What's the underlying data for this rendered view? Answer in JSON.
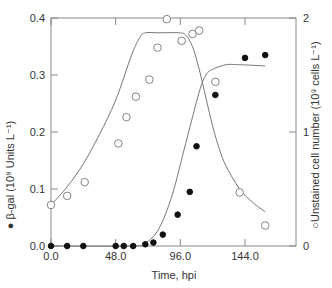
{
  "chart_data": {
    "type": "scatter",
    "title": "",
    "xlabel": "Time, hpi",
    "ylabel_left": "● β-gal (10⁸ Units L⁻¹)",
    "ylabel_right": "○Unstained cell number (10⁹ cells L⁻¹)",
    "xlim": [
      0,
      182
    ],
    "ylim_left": [
      0,
      0.4
    ],
    "ylim_right": [
      0,
      2
    ],
    "x_ticks": [
      "0.0",
      "48.0",
      "96.0",
      "144.0"
    ],
    "x_tick_values": [
      0,
      48,
      96,
      144
    ],
    "y_left_ticks": [
      "0.0",
      "0.1",
      "0.2",
      "0.3",
      "0.4"
    ],
    "y_left_tick_values": [
      0,
      0.1,
      0.2,
      0.3,
      0.4
    ],
    "y_right_ticks": [
      "0",
      "1",
      "2"
    ],
    "y_right_tick_values": [
      0,
      1,
      2
    ],
    "grid": false,
    "legend": "embedded in axis labels (filled circle = β-gal, open circle = unstained cells)",
    "series": [
      {
        "name": "β-gal",
        "axis": "left",
        "marker": "filled-circle",
        "x": [
          0,
          12,
          24,
          48,
          54,
          61,
          70,
          76,
          83,
          94,
          103,
          108,
          122,
          144,
          159
        ],
        "y": [
          0,
          0,
          0,
          0,
          0,
          0,
          0.003,
          0.006,
          0.02,
          0.055,
          0.095,
          0.175,
          0.265,
          0.33,
          0.335
        ]
      },
      {
        "name": "Unstained cell number",
        "axis": "right",
        "marker": "open-circle",
        "x": [
          0,
          12,
          25,
          50,
          56,
          63,
          73,
          79,
          86,
          97,
          105,
          110,
          122,
          140,
          159
        ],
        "y": [
          0.36,
          0.44,
          0.56,
          0.9,
          1.13,
          1.31,
          1.46,
          1.74,
          1.99,
          1.8,
          1.86,
          1.89,
          1.44,
          0.47,
          0.18
        ]
      }
    ],
    "fit_curves": [
      {
        "name": "β-gal fit (sigmoid)",
        "axis": "left",
        "x": [
          0,
          60,
          70,
          80,
          90,
          100,
          110,
          115,
          120,
          130,
          140,
          159
        ],
        "y": [
          0,
          0,
          0.005,
          0.03,
          0.09,
          0.18,
          0.27,
          0.3,
          0.31,
          0.318,
          0.318,
          0.316
        ]
      },
      {
        "name": "Cell number fit",
        "axis": "right",
        "x": [
          0,
          12,
          24,
          36,
          48,
          60,
          66,
          70,
          80,
          95,
          100,
          105,
          110,
          115,
          120,
          125,
          130,
          140,
          150,
          159
        ],
        "y": [
          0.36,
          0.52,
          0.72,
          0.98,
          1.28,
          1.68,
          1.83,
          1.87,
          1.87,
          1.87,
          1.85,
          1.75,
          1.55,
          1.3,
          1.05,
          0.85,
          0.7,
          0.5,
          0.38,
          0.3
        ]
      }
    ]
  }
}
